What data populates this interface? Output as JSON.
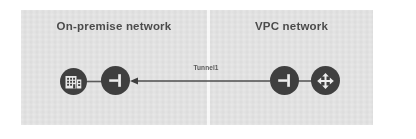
{
  "diagram": {
    "type": "network-topology",
    "title": "",
    "background_color": "#e4e4e4",
    "node_color": "#3f3f3f",
    "line_color": "#5a5a5a",
    "text_color": "#4b4b4b",
    "zones": [
      {
        "id": "on-premise",
        "label": "On-premise network",
        "side": "left"
      },
      {
        "id": "vpc",
        "label": "VPC network",
        "side": "right"
      }
    ],
    "nodes": [
      {
        "id": "datacenter",
        "icon": "building-icon",
        "zone": "on-premise",
        "label": ""
      },
      {
        "id": "onprem-gateway",
        "icon": "vpn-gateway-icon",
        "zone": "on-premise",
        "label": ""
      },
      {
        "id": "vpc-gateway",
        "icon": "vpn-gateway-icon",
        "zone": "vpc",
        "label": ""
      },
      {
        "id": "cloud-router",
        "icon": "router-icon",
        "zone": "vpc",
        "label": ""
      }
    ],
    "links": [
      {
        "from": "datacenter",
        "to": "onprem-gateway",
        "label": "",
        "arrow": false
      },
      {
        "from": "vpc-gateway",
        "to": "onprem-gateway",
        "label": "Tunnel1",
        "arrow": true
      },
      {
        "from": "cloud-router",
        "to": "vpc-gateway",
        "label": "",
        "arrow": false
      }
    ],
    "tunnel_label": "Tunnel1"
  }
}
